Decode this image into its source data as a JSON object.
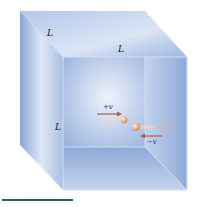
{
  "diagram": {
    "labels": {
      "edge_top_left": "L",
      "edge_top_front": "L",
      "edge_left_vertical": "L",
      "velocity_incoming": "+v",
      "velocity_outgoing": "−v"
    },
    "colors": {
      "cube_face_light": "#dfe8f6",
      "cube_face_mid": "#a9bfe2",
      "cube_face_dark": "#7f9dd0",
      "edge": "#c9d6ee",
      "arrow": "#b05a48",
      "particle": "#e0a070",
      "rule": "#2f5f5a"
    }
  }
}
